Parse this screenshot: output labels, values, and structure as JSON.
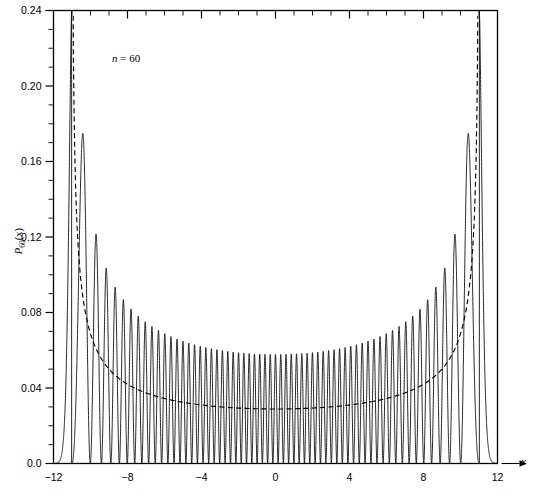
{
  "figure": {
    "annotation": "n = 60",
    "annotation_n": "n",
    "annotation_eq": " = 60",
    "ylabel_main": "P",
    "ylabel_sub": "60",
    "ylabel_arg": "(x)",
    "xaxis_title": "x"
  },
  "chart_data": {
    "type": "line",
    "title": "",
    "subtitle": "",
    "xlabel": "x",
    "ylabel": "P60(x)",
    "xlim": [
      -12,
      12
    ],
    "ylim": [
      0.0,
      0.24
    ],
    "grid": false,
    "legend": "none",
    "x_ticks": [
      -12,
      -8,
      -4,
      0,
      4,
      8,
      12
    ],
    "x_tick_labels": [
      "-12",
      "-8",
      "-4",
      "0",
      "4",
      "8",
      "12"
    ],
    "x_minor_step": 1,
    "y_ticks": [
      0.0,
      0.04,
      0.08,
      0.12,
      0.16,
      0.2,
      0.24
    ],
    "y_tick_labels": [
      "0.0",
      "0.04",
      "0.08",
      "0.12",
      "0.16",
      "0.20",
      "0.24"
    ],
    "y_minor_step": 0.01,
    "quantum_number": 60,
    "turning_point": 11.02,
    "annotations": [
      {
        "text": "n = 60",
        "x": -7.2,
        "y": 0.213
      }
    ],
    "series": [
      {
        "name": "quantum probability density",
        "style": "solid",
        "color": "#000000",
        "description": "Oscillating |psi_60(x)|^2 for the harmonic oscillator; 61 peaks between the classical turning points at x = -11.02 and x = +11.02, peak envelope following the classical distribution, nodes touching zero, decaying exponentially beyond the turning points.",
        "envelope_formula": "2/(pi*sqrt(a^2 - x^2)) with a = 11.02",
        "peak_max": 0.205,
        "center_peak_value": 0.0578
      },
      {
        "name": "classical probability density",
        "style": "dashed",
        "color": "#000000",
        "description": "Classical distribution P_cl(x) = 1/(pi*sqrt(a^2 - x^2)) with a = 11.02; diverges at the turning points and has a minimum at the origin.",
        "formula": "1/(pi*sqrt(a^2 - x^2))",
        "a": 11.02,
        "min_value": 0.0289,
        "sample_points": [
          {
            "x": -11.0,
            "y": 0.24
          },
          {
            "x": -10.9,
            "y": 0.215
          },
          {
            "x": -10.5,
            "y": 0.1376
          },
          {
            "x": -10.0,
            "y": 0.0929
          },
          {
            "x": -9.5,
            "y": 0.0746
          },
          {
            "x": -9.0,
            "y": 0.0637
          },
          {
            "x": -8.0,
            "y": 0.0508
          },
          {
            "x": -7.0,
            "y": 0.0433
          },
          {
            "x": -6.0,
            "y": 0.0384
          },
          {
            "x": -5.0,
            "y": 0.0351
          },
          {
            "x": -4.0,
            "y": 0.0327
          },
          {
            "x": -3.0,
            "y": 0.0309
          },
          {
            "x": -2.0,
            "y": 0.0297
          },
          {
            "x": -1.0,
            "y": 0.0291
          },
          {
            "x": 0.0,
            "y": 0.0289
          },
          {
            "x": 1.0,
            "y": 0.0291
          },
          {
            "x": 2.0,
            "y": 0.0297
          },
          {
            "x": 3.0,
            "y": 0.0309
          },
          {
            "x": 4.0,
            "y": 0.0327
          },
          {
            "x": 5.0,
            "y": 0.0351
          },
          {
            "x": 6.0,
            "y": 0.0384
          },
          {
            "x": 7.0,
            "y": 0.0433
          },
          {
            "x": 8.0,
            "y": 0.0508
          },
          {
            "x": 9.0,
            "y": 0.0637
          },
          {
            "x": 9.5,
            "y": 0.0746
          },
          {
            "x": 10.0,
            "y": 0.0929
          },
          {
            "x": 10.5,
            "y": 0.1376
          },
          {
            "x": 10.9,
            "y": 0.215
          },
          {
            "x": 11.0,
            "y": 0.24
          }
        ]
      }
    ]
  }
}
